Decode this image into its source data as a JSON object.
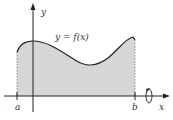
{
  "diagram": {
    "type": "area under curve with rotation",
    "function_label": "y = f(x)",
    "x_axis_label": "x",
    "y_axis_label": "y",
    "left_bound_label": "a",
    "right_bound_label": "b",
    "rotation_icon": "rotation-about-x-axis",
    "colors": {
      "fill": "#d6d6d6",
      "stroke": "#222222",
      "background": "#ffffff"
    }
  }
}
